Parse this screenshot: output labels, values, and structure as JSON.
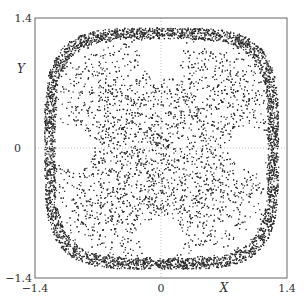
{
  "chart_data": {
    "type": "scatter",
    "title": "",
    "xlabel": "X",
    "ylabel": "Y",
    "xlim": [
      -1.4,
      1.4
    ],
    "ylim": [
      -1.4,
      1.4
    ],
    "x_ticks": [
      "-1.4",
      "0",
      "1.4"
    ],
    "y_ticks": [
      "1.4",
      "0",
      "-1.4"
    ],
    "grid": "dotted lines at X=0 and Y=0",
    "legend": "none",
    "regions": {
      "outer_band_extent": 1.3,
      "central_square_halfwidth": 0.7,
      "holes": [
        {
          "name": "top",
          "cx": 0.0,
          "cy": 0.98,
          "r": 0.23
        },
        {
          "name": "bottom",
          "cx": 0.0,
          "cy": -0.98,
          "r": 0.23
        },
        {
          "name": "left",
          "cx": -0.98,
          "cy": 0.0,
          "r": 0.23
        },
        {
          "name": "right",
          "cx": 0.98,
          "cy": 0.0,
          "r": 0.23
        }
      ]
    },
    "point_color": "#2a2a2a"
  }
}
